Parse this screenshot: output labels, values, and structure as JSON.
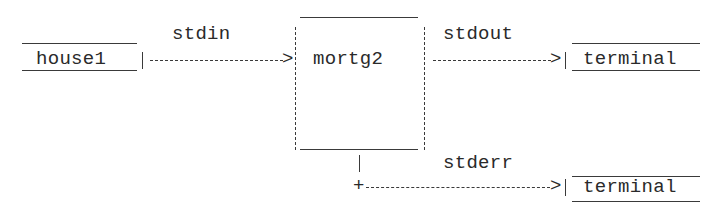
{
  "diagram": {
    "type": "ascii-dataflow",
    "nodes": [
      {
        "id": "input",
        "label": "house1"
      },
      {
        "id": "process",
        "label": "mortg2"
      },
      {
        "id": "out_terminal",
        "label": "terminal"
      },
      {
        "id": "err_terminal",
        "label": "terminal"
      }
    ],
    "edges": [
      {
        "from": "input",
        "to": "process",
        "label": "stdin"
      },
      {
        "from": "process",
        "to": "out_terminal",
        "label": "stdout"
      },
      {
        "from": "process",
        "to": "err_terminal",
        "label": "stderr"
      }
    ],
    "arrow_text": {
      "stdin_arrow": "|----------->|",
      "stdout_arrow": "|--------->|",
      "stderr_corner": "+",
      "stderr_arrow": "--------------->|",
      "pipe": "|",
      "arrowhead": ">"
    }
  }
}
